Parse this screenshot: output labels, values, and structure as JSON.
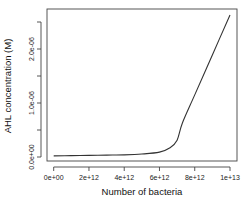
{
  "chart_data": {
    "type": "line",
    "title": "",
    "xlabel": "Number of bacteria",
    "ylabel": "AHL concentration (M)",
    "xlim": [
      0,
      10000000000000.0
    ],
    "ylim": [
      0,
      2.65e-06
    ],
    "grid": false,
    "legend": null,
    "x_ticks": [
      0,
      2000000000000.0,
      4000000000000.0,
      6000000000000.0,
      8000000000000.0,
      10000000000000.0
    ],
    "x_tick_labels": [
      "0e+00",
      "2e+12",
      "4e+12",
      "6e+12",
      "8e+12",
      "1e+13"
    ],
    "y_ticks": [
      0,
      5e-07,
      1e-06,
      1.5e-06,
      2e-06,
      2.5e-06
    ],
    "y_tick_labels": [
      "0.0e+00",
      "",
      "1.0e-06",
      "",
      "2.0e-06",
      ""
    ],
    "series": [
      {
        "name": "AHL",
        "color": "#333333",
        "x": [
          0,
          1000000000000.0,
          2000000000000.0,
          3000000000000.0,
          4000000000000.0,
          5000000000000.0,
          6000000000000.0,
          6600000000000.0,
          7000000000000.0,
          7300000000000.0,
          8000000000000.0,
          9000000000000.0,
          10000000000000.0
        ],
        "y": [
          2e-08,
          2.5e-08,
          3e-08,
          3.5e-08,
          4e-08,
          5.5e-08,
          9e-08,
          1.7e-07,
          3.1e-07,
          6.3e-07,
          1.15e-06,
          1.89e-06,
          2.63e-06
        ]
      }
    ]
  }
}
